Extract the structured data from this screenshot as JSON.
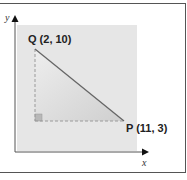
{
  "diagram": {
    "type": "coordinate-right-triangle",
    "axes": {
      "x_label": "x",
      "y_label": "y"
    },
    "points": [
      {
        "name": "Q",
        "label": "Q  (2, 10)",
        "x": 2,
        "y": 10
      },
      {
        "name": "P",
        "label": "P (11, 3)",
        "x": 11,
        "y": 3
      }
    ],
    "right_angle_vertex": {
      "x": 2,
      "y": 3
    },
    "colors": {
      "panel": "#e6e6e6",
      "triangle_fill": "#d9d9d9",
      "hypotenuse": "#666666",
      "dashed_legs": "#9a9a9a",
      "axis": "#555555"
    }
  }
}
